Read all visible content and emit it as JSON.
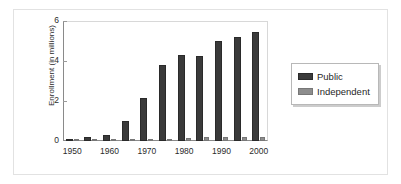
{
  "chart_data": {
    "type": "bar",
    "title": "",
    "xlabel": "",
    "ylabel": "Enrollment (in millions)",
    "categories": [
      "1950",
      "1955",
      "1960",
      "1965",
      "1970",
      "1975",
      "1980",
      "1985",
      "1990",
      "1995",
      "2000"
    ],
    "xtick_labels": [
      "1950",
      "1960",
      "1970",
      "1980",
      "1990",
      "2000"
    ],
    "xtick_categories": [
      "1950",
      "1960",
      "1970",
      "1980",
      "1990",
      "2000"
    ],
    "ytick_labels": [
      "0",
      "2",
      "4",
      "6"
    ],
    "yticks": [
      0,
      2,
      4,
      6
    ],
    "ylim": [
      0,
      6
    ],
    "grid": false,
    "legend_position": "right",
    "series": [
      {
        "name": "Public",
        "color": "#3a3a3a",
        "values": [
          0.1,
          0.2,
          0.3,
          1.0,
          2.15,
          3.8,
          4.3,
          4.25,
          5.0,
          5.2,
          5.45
        ]
      },
      {
        "name": "Independent",
        "color": "#8d8d8d",
        "values": [
          0.02,
          0.03,
          0.03,
          0.08,
          0.1,
          0.1,
          0.17,
          0.2,
          0.2,
          0.19,
          0.2
        ]
      }
    ]
  },
  "legend": {
    "entries": [
      {
        "label": "Public"
      },
      {
        "label": "Independent"
      }
    ]
  },
  "axes": {
    "y_axis_label": "Enrollment (in millions)"
  }
}
